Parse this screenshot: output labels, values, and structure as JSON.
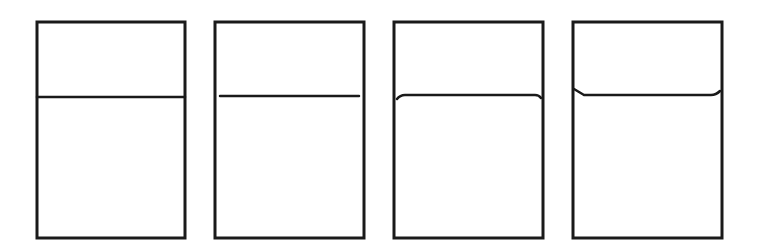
{
  "diagram": {
    "stroke_color": "#1a1a1a",
    "background_color": "#ffffff",
    "box_stroke_width": 3,
    "line_stroke_width": 2.5,
    "panels": [
      {
        "id": "panel-1",
        "meniscus": "flat-touching-walls",
        "box": {
          "x": 37,
          "y": 22,
          "w": 148,
          "h": 216
        },
        "surface_path": "M 37 97 L 185 97"
      },
      {
        "id": "panel-2",
        "meniscus": "flat-not-touching-walls",
        "box": {
          "x": 215,
          "y": 22,
          "w": 149,
          "h": 216
        },
        "surface_path": "M 220 96 L 359 96"
      },
      {
        "id": "panel-3",
        "meniscus": "convex-edges-curve-down",
        "box": {
          "x": 394,
          "y": 22,
          "w": 149,
          "h": 216
        },
        "surface_path": "M 397 99 Q 400 95 405 95 L 535 95 Q 539 95 541 98"
      },
      {
        "id": "panel-4",
        "meniscus": "concave-edges-curve-up",
        "box": {
          "x": 573,
          "y": 22,
          "w": 149,
          "h": 216
        },
        "surface_path": "M 574 89 Q 579 92 584 95 L 711 95 Q 716 95 720 91"
      }
    ]
  }
}
